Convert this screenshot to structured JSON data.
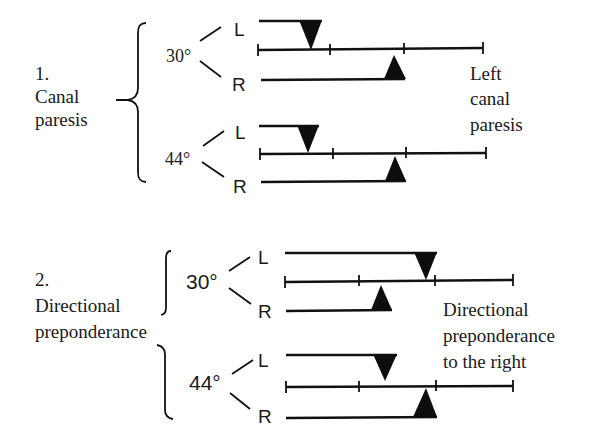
{
  "figure": {
    "sections": [
      {
        "number": "1.",
        "label_lines": [
          "Canal",
          "paresis"
        ],
        "conclusion_lines": [
          "Left",
          "canal",
          "paresis"
        ],
        "rows": [
          {
            "temperature": "30°",
            "left_label": "L",
            "right_label": "R"
          },
          {
            "temperature": "44°",
            "left_label": "L",
            "right_label": "R"
          }
        ]
      },
      {
        "number": "2.",
        "label_lines": [
          "Directional",
          "preponderance"
        ],
        "conclusion_lines": [
          "Directional",
          "preponderance",
          "to the right"
        ],
        "rows": [
          {
            "temperature": "30°",
            "left_label": "L",
            "right_label": "R"
          },
          {
            "temperature": "44°",
            "left_label": "L",
            "right_label": "R"
          }
        ]
      }
    ]
  }
}
